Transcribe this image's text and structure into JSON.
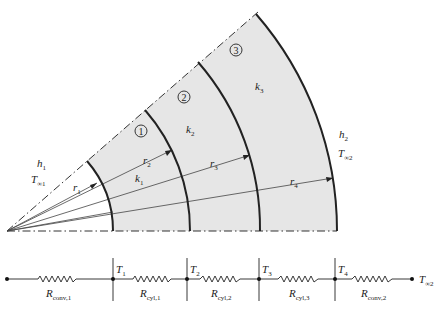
{
  "diagram": {
    "type": "multilayer cylindrical wall cross-section with thermal resistance network",
    "regions": [
      {
        "id": "1",
        "circle_label": "1",
        "conductivity": "k",
        "conductivity_sub": "1"
      },
      {
        "id": "2",
        "circle_label": "2",
        "conductivity": "k",
        "conductivity_sub": "2"
      },
      {
        "id": "3",
        "circle_label": "3",
        "conductivity": "k",
        "conductivity_sub": "3"
      }
    ],
    "radii": [
      {
        "sym": "r",
        "sub": "1"
      },
      {
        "sym": "r",
        "sub": "2"
      },
      {
        "sym": "r",
        "sub": "3"
      },
      {
        "sym": "r",
        "sub": "4"
      }
    ],
    "inner_side": {
      "h": "h",
      "h_sub": "1",
      "T": "T",
      "T_sub": "∞1"
    },
    "outer_side": {
      "h": "h",
      "h_sub": "2",
      "T": "T",
      "T_sub": "∞2"
    },
    "colors": {
      "fill": "#e6e6e6",
      "stroke": "#222222"
    }
  },
  "network": {
    "nodes": [
      {
        "sym": "T",
        "sub": "1"
      },
      {
        "sym": "T",
        "sub": "2"
      },
      {
        "sym": "T",
        "sub": "3"
      },
      {
        "sym": "T",
        "sub": "4"
      }
    ],
    "end_node": {
      "sym": "T",
      "sub": "∞2"
    },
    "resistors": [
      {
        "sym": "R",
        "sub": "conv,1"
      },
      {
        "sym": "R",
        "sub": "cyl,1"
      },
      {
        "sym": "R",
        "sub": "cyl,2"
      },
      {
        "sym": "R",
        "sub": "cyl,3"
      },
      {
        "sym": "R",
        "sub": "conv,2"
      }
    ]
  }
}
